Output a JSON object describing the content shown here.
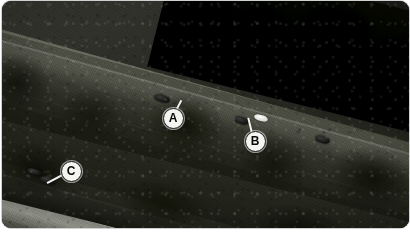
{
  "scene": {
    "type": "aerial-photograph",
    "palette": "grayscale",
    "description": "Aerial black-and-white photograph of a divided highway with a vegetated median",
    "frame": {
      "corner_radius_px": 9,
      "background": "#ffffff"
    }
  },
  "markers": [
    {
      "id": "A",
      "label": "A",
      "x": 172,
      "y": 117,
      "points_to": "dark-vehicle-upper-left",
      "leader": {
        "angle_deg": -62,
        "length_px": 20
      }
    },
    {
      "id": "B",
      "label": "B",
      "x": 254,
      "y": 140,
      "points_to": "dark-vehicle-upper-right",
      "leader": {
        "angle_deg": -104,
        "length_px": 24
      }
    },
    {
      "id": "C",
      "label": "C",
      "x": 70,
      "y": 170,
      "points_to": "dark-vehicle-lower",
      "leader": {
        "angle_deg": 152,
        "length_px": 26
      }
    }
  ],
  "vehicles": [
    {
      "name": "vehicle-a-upper",
      "tone": "dark",
      "x": 162,
      "y": 98,
      "w": 16,
      "h": 7,
      "rot": 16
    },
    {
      "name": "vehicle-b-upper",
      "tone": "dark",
      "x": 241,
      "y": 120,
      "w": 15,
      "h": 7,
      "rot": 16
    },
    {
      "name": "vehicle-white-upper",
      "tone": "light",
      "x": 261,
      "y": 118,
      "w": 14,
      "h": 6,
      "rot": 16
    },
    {
      "name": "vehicle-far-right",
      "tone": "dark",
      "x": 322,
      "y": 139,
      "w": 15,
      "h": 7,
      "rot": 16
    },
    {
      "name": "vehicle-c-lower",
      "tone": "dark",
      "x": 48,
      "y": 180,
      "w": 16,
      "h": 7,
      "rot": 16
    },
    {
      "name": "vehicle-lower-left",
      "tone": "dark",
      "x": 34,
      "y": 172,
      "w": 15,
      "h": 6,
      "rot": 16
    }
  ],
  "roadways": [
    {
      "name": "upper-roadway",
      "orientation_deg": 15.5,
      "lanes": 2,
      "edge_lines": 3
    },
    {
      "name": "lower-roadway",
      "orientation_deg": 15.5,
      "lanes": 2,
      "edge_lines": 3
    }
  ],
  "regions": [
    {
      "name": "top-forest-canopy",
      "tone": "very-dark"
    },
    {
      "name": "median-vegetation",
      "tone": "dark"
    },
    {
      "name": "bottom-vegetation",
      "tone": "dark"
    },
    {
      "name": "left-treeline",
      "tone": "dark"
    }
  ]
}
